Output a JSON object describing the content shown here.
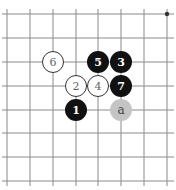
{
  "board": {
    "grid": {
      "xs": [
        7,
        30,
        53,
        76,
        98,
        121,
        144,
        167
      ],
      "ys": [
        14,
        38,
        62,
        86,
        110,
        133,
        157,
        181
      ],
      "line_color": "#8a8a8a"
    },
    "star_points": [
      {
        "col": 7,
        "row": 0
      }
    ],
    "stones": [
      {
        "label": "1",
        "color": "black",
        "col": 3,
        "row": 4
      },
      {
        "label": "2",
        "color": "white",
        "col": 3,
        "row": 3
      },
      {
        "label": "3",
        "color": "black",
        "col": 5,
        "row": 2
      },
      {
        "label": "4",
        "color": "white",
        "col": 4,
        "row": 3
      },
      {
        "label": "5",
        "color": "black",
        "col": 4,
        "row": 2
      },
      {
        "label": "6",
        "color": "white",
        "col": 2,
        "row": 2
      },
      {
        "label": "7",
        "color": "black",
        "col": 5,
        "row": 3
      },
      {
        "label": "a",
        "color": "marker",
        "col": 5,
        "row": 4
      }
    ]
  }
}
